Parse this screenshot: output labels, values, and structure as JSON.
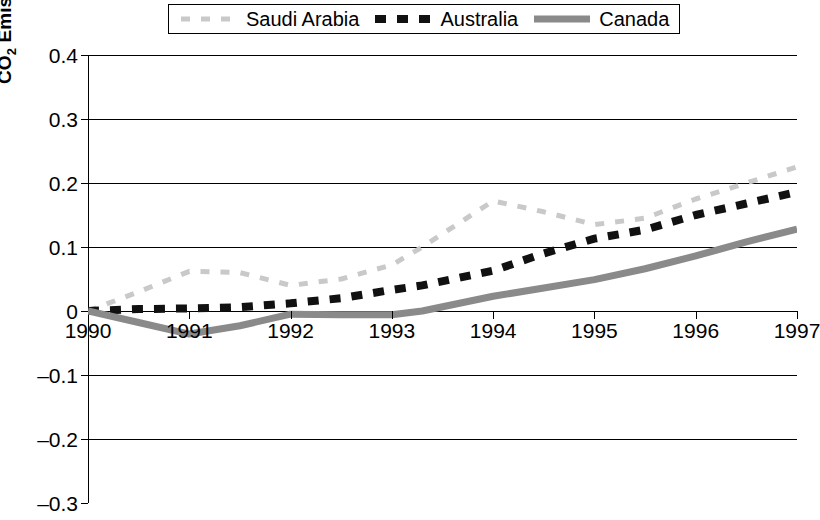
{
  "legend": {
    "position": "top-center",
    "entries": [
      {
        "label": "Saudi Arabia",
        "key": "dashed-line-light-gray",
        "color": "#c9c9c9"
      },
      {
        "label": "Australia",
        "key": "dashed-line-black",
        "color": "#111111"
      },
      {
        "label": "Canada",
        "key": "solid-line-gray",
        "color": "#8a8a8a"
      }
    ]
  },
  "axes": {
    "ylabel_pre": "CO",
    "ylabel_sub": "2",
    "ylabel_post": " Emissions Normalized to 1990",
    "yticks": [
      "0.4",
      "0.3",
      "0.2",
      "0.1",
      "0",
      "–0.1",
      "–0.2",
      "–0.3"
    ],
    "xticks": [
      "1990",
      "1991",
      "1992",
      "1993",
      "1994",
      "1995",
      "1996",
      "1997"
    ]
  },
  "chart_data": {
    "type": "line",
    "title": "",
    "xlabel": "",
    "ylabel": "CO2 Emissions Normalized to 1990",
    "xlim": [
      1990,
      1997
    ],
    "ylim": [
      -0.3,
      0.4
    ],
    "ytick_values": [
      0.4,
      0.3,
      0.2,
      0.1,
      0,
      -0.1,
      -0.2,
      -0.3
    ],
    "xtick_values": [
      1990,
      1991,
      1992,
      1993,
      1994,
      1995,
      1996,
      1997
    ],
    "grid": "horizontal",
    "legend_position": "top-center",
    "x": [
      1990,
      1990.5,
      1991,
      1991.5,
      1992,
      1992.5,
      1993,
      1993.3,
      1994,
      1994.5,
      1995,
      1995.5,
      1996,
      1996.5,
      1997
    ],
    "series": [
      {
        "name": "Saudi Arabia",
        "color": "#c9c9c9",
        "style": "dashed",
        "values": [
          0.0,
          0.03,
          0.062,
          0.06,
          0.04,
          0.05,
          0.072,
          0.1,
          0.172,
          0.155,
          0.135,
          0.145,
          0.175,
          0.2,
          0.225
        ]
      },
      {
        "name": "Australia",
        "color": "#111111",
        "style": "dashed",
        "values": [
          0.0,
          0.003,
          0.004,
          0.006,
          0.012,
          0.02,
          0.033,
          0.04,
          0.063,
          0.09,
          0.113,
          0.127,
          0.15,
          0.168,
          0.186
        ]
      },
      {
        "name": "Canada",
        "color": "#8a8a8a",
        "style": "solid",
        "values": [
          0.0,
          -0.018,
          -0.036,
          -0.023,
          -0.005,
          -0.006,
          -0.006,
          0.0,
          0.023,
          0.036,
          0.049,
          0.066,
          0.086,
          0.108,
          0.128
        ]
      }
    ]
  }
}
